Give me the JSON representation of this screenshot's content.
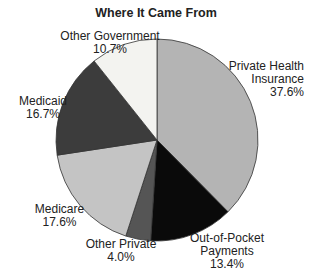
{
  "chart_data": {
    "type": "pie",
    "title": "Where It Came From",
    "start_angle": "12 o'clock",
    "direction": "clockwise",
    "slices": [
      {
        "label": "Private Health Insurance",
        "label_lines": [
          "Private Health",
          "Insurance"
        ],
        "value": 37.6,
        "pct_text": "37.6%",
        "color": "#b4b4b4"
      },
      {
        "label": "Out-of-Pocket Payments",
        "label_lines": [
          "Out-of-Pocket",
          "Payments"
        ],
        "value": 13.4,
        "pct_text": "13.4%",
        "color": "#0a0a0a"
      },
      {
        "label": "Other Private",
        "label_lines": [
          "Other Private"
        ],
        "value": 4.0,
        "pct_text": "4.0%",
        "color": "#555555"
      },
      {
        "label": "Medicare",
        "label_lines": [
          "Medicare"
        ],
        "value": 17.6,
        "pct_text": "17.6%",
        "color": "#c4c4c4"
      },
      {
        "label": "Medicaid",
        "label_lines": [
          "Medicaid"
        ],
        "value": 16.7,
        "pct_text": "16.7%",
        "color": "#3c3c3c"
      },
      {
        "label": "Other Government",
        "label_lines": [
          "Other Government"
        ],
        "value": 10.7,
        "pct_text": "10.7%",
        "color": "#f3f3f0"
      }
    ],
    "legend": "none (direct labels)"
  },
  "labels": {
    "private_health": {
      "line1": "Private Health",
      "line2": "Insurance",
      "pct": "37.6%"
    },
    "out_of_pocket": {
      "line1": "Out-of-Pocket",
      "line2": "Payments",
      "pct": "13.4%"
    },
    "other_private": {
      "line1": "Other Private",
      "pct": "4.0%"
    },
    "medicare": {
      "line1": "Medicare",
      "pct": "17.6%"
    },
    "medicaid": {
      "line1": "Medicaid",
      "pct": "16.7%"
    },
    "other_government": {
      "line1": "Other Government",
      "pct": "10.7%"
    }
  }
}
